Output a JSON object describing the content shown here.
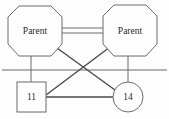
{
  "diagram": {
    "type": "genogram",
    "background_color": "#fdfdfd",
    "stroke_color": "#6b6b6b",
    "text_color": "#2b2b2b",
    "nodes": [
      {
        "id": "parent-left",
        "shape": "octagon",
        "label": "Parent",
        "cx": 35,
        "cy": 31,
        "rx": 27,
        "ry": 26
      },
      {
        "id": "parent-right",
        "shape": "octagon",
        "label": "Parent",
        "cx": 130,
        "cy": 31,
        "rx": 28,
        "ry": 26
      },
      {
        "id": "child-11",
        "shape": "square",
        "label": "11",
        "x": 17,
        "y": 82,
        "width": 29,
        "height": 30
      },
      {
        "id": "child-14",
        "shape": "circle",
        "label": "14",
        "cx": 128,
        "cy": 97,
        "r": 15
      }
    ],
    "edges": [
      {
        "id": "union-parents-top",
        "kind": "union",
        "from": "parent-left",
        "to": "parent-right"
      },
      {
        "id": "union-parents-bottom",
        "kind": "union",
        "from": "parent-left",
        "to": "parent-right"
      },
      {
        "id": "sibling-bar",
        "kind": "horizontal-rule",
        "from": "left-edge",
        "to": "right-edge"
      },
      {
        "id": "parent-left-to-11",
        "kind": "descent",
        "from": "parent-left",
        "to": "child-11"
      },
      {
        "id": "parent-right-to-14",
        "kind": "descent",
        "from": "parent-right",
        "to": "child-14"
      },
      {
        "id": "parent-left-to-14",
        "kind": "descent-diagonal",
        "from": "parent-left",
        "to": "child-14"
      },
      {
        "id": "parent-right-to-11",
        "kind": "descent-diagonal",
        "from": "parent-right",
        "to": "child-11"
      },
      {
        "id": "link-11-to-14",
        "kind": "sibling",
        "from": "child-11",
        "to": "child-14"
      }
    ]
  }
}
